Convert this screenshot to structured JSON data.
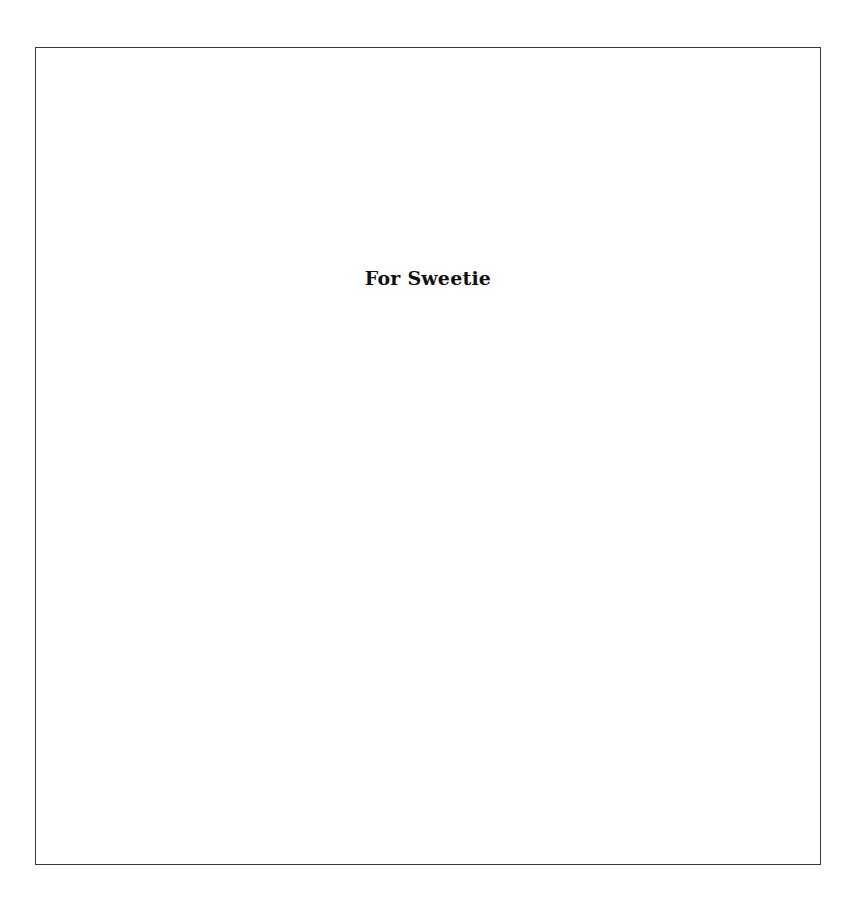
{
  "page": {
    "dedication": "For Sweetie"
  }
}
